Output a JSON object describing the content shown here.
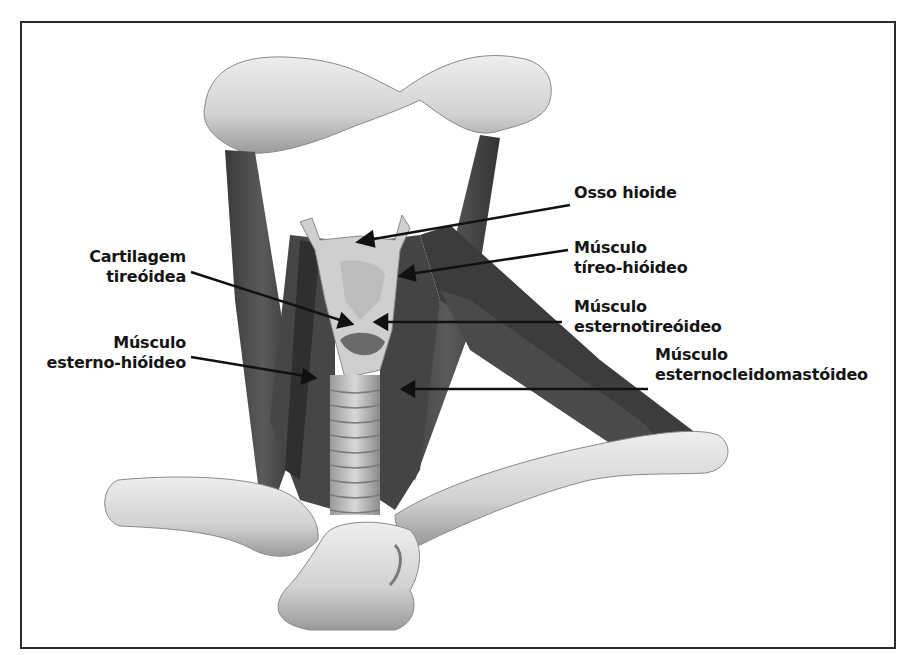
{
  "diagram": {
    "labels": [
      {
        "id": "osso-hioide",
        "lines": [
          "Osso hioide"
        ]
      },
      {
        "id": "musculo-tireo-hioideo",
        "lines": [
          "Músculo",
          "tíreo-hióideo"
        ]
      },
      {
        "id": "cartilagem-tireoidea",
        "lines": [
          "Cartilagem",
          "tireóidea"
        ]
      },
      {
        "id": "musculo-esternotireoideo",
        "lines": [
          "Músculo",
          "esternotireóideo"
        ]
      },
      {
        "id": "musculo-esterno-hioideo",
        "lines": [
          "Músculo",
          "esterno-hióideo"
        ]
      },
      {
        "id": "musculo-esternocleidomastoideo",
        "lines": [
          "Músculo",
          "esternocleidomastóideo"
        ]
      }
    ],
    "colors": {
      "frame": "#2a2a2a",
      "muscle": "#4a4a4a",
      "bone": "#d8d8d8",
      "text": "#151515"
    }
  }
}
